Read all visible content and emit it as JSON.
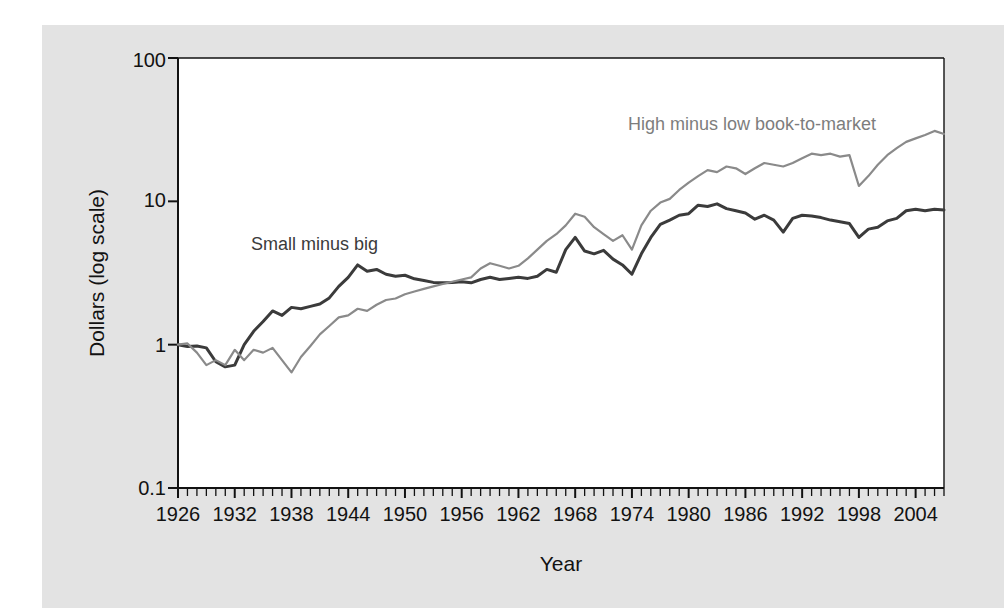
{
  "figure": {
    "background_color": "#ffffff",
    "panel_color": "#e3e3e3",
    "plot_area_color": "#ffffff",
    "axis_color": "#121212"
  },
  "labels": {
    "ylabel": "Dollars (log scale)",
    "xlabel": "Year",
    "series_small_minus_big": "Small minus big",
    "series_high_minus_low": "High minus low book-to-market",
    "ytick_100": "100",
    "ytick_10": "10",
    "ytick_1": "1",
    "ytick_0_1": "0.1"
  },
  "chart_data": {
    "type": "line",
    "title": "",
    "xlabel": "Year",
    "ylabel": "Dollars (log scale)",
    "yscale": "log",
    "ylim": [
      0.1,
      100
    ],
    "xlim": [
      1926,
      2007
    ],
    "grid": false,
    "legend_position": "inline-annotations",
    "yticks": [
      0.1,
      1,
      10,
      100
    ],
    "ytick_labels": [
      "0.1",
      "1",
      "10",
      "100"
    ],
    "xticks": [
      1926,
      1932,
      1938,
      1944,
      1950,
      1956,
      1962,
      1968,
      1974,
      1980,
      1986,
      1992,
      1998,
      2004
    ],
    "xtick_labels": [
      "1926",
      "1932",
      "1938",
      "1944",
      "1950",
      "1956",
      "1962",
      "1968",
      "1974",
      "1980",
      "1986",
      "1992",
      "1998",
      "2004"
    ],
    "minor_xticks_interval": 1,
    "x": [
      1926,
      1927,
      1928,
      1929,
      1930,
      1931,
      1932,
      1933,
      1934,
      1935,
      1936,
      1937,
      1938,
      1939,
      1940,
      1941,
      1942,
      1943,
      1944,
      1945,
      1946,
      1947,
      1948,
      1949,
      1950,
      1951,
      1952,
      1953,
      1954,
      1955,
      1956,
      1957,
      1958,
      1959,
      1960,
      1961,
      1962,
      1963,
      1964,
      1965,
      1966,
      1967,
      1968,
      1969,
      1970,
      1971,
      1972,
      1973,
      1974,
      1975,
      1976,
      1977,
      1978,
      1979,
      1980,
      1981,
      1982,
      1983,
      1984,
      1985,
      1986,
      1987,
      1988,
      1989,
      1990,
      1991,
      1992,
      1993,
      1994,
      1995,
      1996,
      1997,
      1998,
      1999,
      2000,
      2001,
      2002,
      2003,
      2004,
      2005,
      2006,
      2007
    ],
    "series": [
      {
        "name": "Small minus big",
        "color": "#3b3b3b",
        "linewidth": 3.0,
        "values": [
          1.0,
          0.97,
          0.98,
          0.95,
          0.76,
          0.7,
          0.72,
          1.0,
          1.24,
          1.45,
          1.72,
          1.6,
          1.82,
          1.78,
          1.85,
          1.92,
          2.12,
          2.55,
          2.95,
          3.6,
          3.25,
          3.35,
          3.1,
          3.0,
          3.05,
          2.88,
          2.8,
          2.72,
          2.7,
          2.72,
          2.75,
          2.7,
          2.85,
          2.95,
          2.85,
          2.9,
          2.95,
          2.9,
          3.0,
          3.35,
          3.2,
          4.6,
          5.6,
          4.5,
          4.3,
          4.55,
          3.95,
          3.6,
          3.1,
          4.3,
          5.6,
          6.9,
          7.4,
          8.0,
          8.2,
          9.4,
          9.2,
          9.6,
          8.9,
          8.6,
          8.3,
          7.5,
          8.0,
          7.4,
          6.1,
          7.6,
          8.0,
          7.9,
          7.7,
          7.4,
          7.2,
          7.0,
          5.6,
          6.4,
          6.6,
          7.3,
          7.6,
          8.6,
          8.8,
          8.6,
          8.8,
          8.7
        ]
      },
      {
        "name": "High minus low book-to-market",
        "color": "#8a8a8a",
        "linewidth": 2.2,
        "values": [
          1.0,
          1.02,
          0.88,
          0.72,
          0.78,
          0.72,
          0.92,
          0.78,
          0.92,
          0.88,
          0.95,
          0.78,
          0.64,
          0.82,
          0.98,
          1.18,
          1.35,
          1.55,
          1.6,
          1.78,
          1.72,
          1.9,
          2.05,
          2.1,
          2.25,
          2.35,
          2.45,
          2.55,
          2.65,
          2.75,
          2.85,
          2.95,
          3.4,
          3.7,
          3.55,
          3.4,
          3.55,
          4.0,
          4.6,
          5.3,
          5.9,
          6.8,
          8.2,
          7.8,
          6.6,
          5.9,
          5.3,
          5.8,
          4.6,
          6.8,
          8.6,
          9.8,
          10.4,
          12.0,
          13.5,
          15.0,
          16.5,
          16.0,
          17.5,
          17.0,
          15.5,
          17.0,
          18.5,
          18.0,
          17.5,
          18.5,
          20.0,
          21.5,
          21.0,
          21.5,
          20.5,
          21.0,
          12.8,
          15.0,
          18.0,
          21.0,
          23.5,
          26.0,
          27.5,
          29.0,
          31.0,
          29.5
        ]
      }
    ],
    "annotations": [
      {
        "text": "Small minus big",
        "x": 1942,
        "y": 4.6,
        "color": "#3b3b3b"
      },
      {
        "text": "High minus low book-to-market",
        "x": 1983,
        "y": 38,
        "color": "#7d7d7d"
      }
    ]
  }
}
